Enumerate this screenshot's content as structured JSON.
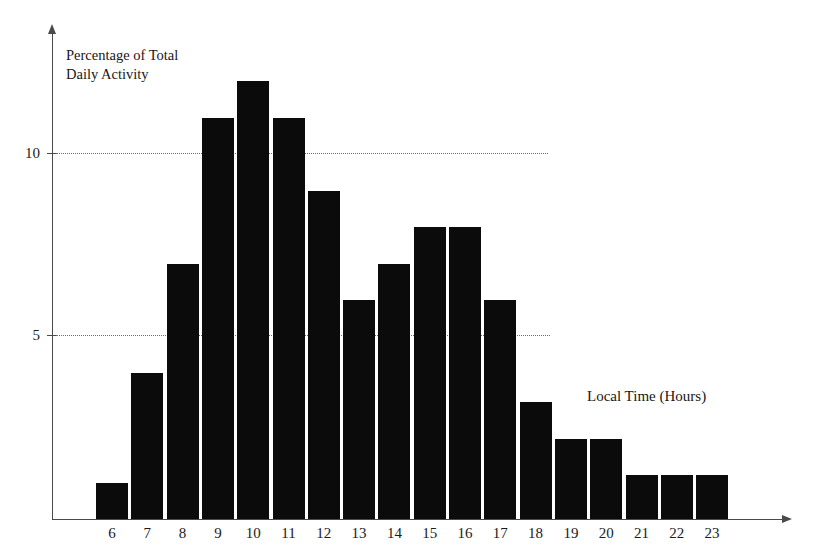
{
  "chart_data": {
    "type": "bar",
    "title": "",
    "subtitle": "",
    "xlabel": "Local Time (Hours)",
    "ylabel": "Percentage of Total\nDaily Activity",
    "categories": [
      "6",
      "7",
      "8",
      "9",
      "10",
      "11",
      "12",
      "13",
      "14",
      "15",
      "16",
      "17",
      "18",
      "19",
      "20",
      "21",
      "22",
      "23"
    ],
    "values": [
      1,
      4,
      7,
      11,
      12,
      11,
      9,
      6,
      7,
      8,
      8,
      6,
      3.2,
      2.2,
      2.2,
      1.2,
      1.2,
      1.2
    ],
    "series": [
      {
        "name": "Percentage of Total Daily Activity",
        "values": [
          1,
          4,
          7,
          11,
          12,
          11,
          9,
          6,
          7,
          8,
          8,
          6,
          3.2,
          2.2,
          2.2,
          1.2,
          1.2,
          1.2
        ]
      }
    ],
    "xlim": [
      5.5,
      23.5
    ],
    "ylim": [
      0,
      13.3
    ],
    "y_ticks": [
      5,
      10
    ],
    "y_tick_labels": [
      "5",
      "10"
    ],
    "x_ticks": [
      "6",
      "7",
      "8",
      "9",
      "10",
      "11",
      "12",
      "13",
      "14",
      "15",
      "16",
      "17",
      "18",
      "19",
      "20",
      "21",
      "22",
      "23"
    ],
    "grid": "horizontal-dotted",
    "legend": "none",
    "bar_color": "#0b0b0b",
    "axis_color": "#4a4a4a",
    "gridline_color": "#6d6d6d",
    "background_color": "#ffffff",
    "annotations": []
  },
  "axis": {
    "y_title": "Percentage of Total\nDaily Activity",
    "x_title": "Local Time (Hours)",
    "y_tick_10": "10",
    "y_tick_5": "5"
  }
}
